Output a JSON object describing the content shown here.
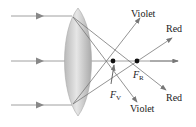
{
  "diagram": {
    "labels": {
      "violet_top": "Violet",
      "red_top": "Red",
      "red_bottom": "Red",
      "violet_bottom": "Violet",
      "focal_red": "F",
      "focal_red_sub": "R",
      "focal_violet": "F",
      "focal_violet_sub": "V"
    },
    "colors": {
      "ray": "#777777",
      "lens_fill": "#c8c8c8",
      "lens_edge": "#a9a9a9",
      "point": "#111111",
      "text": "#222222"
    },
    "incident_rays_y": [
      16,
      61,
      105
    ],
    "focal_points": {
      "violet": [
        113,
        61
      ],
      "red": [
        137,
        61
      ]
    }
  }
}
